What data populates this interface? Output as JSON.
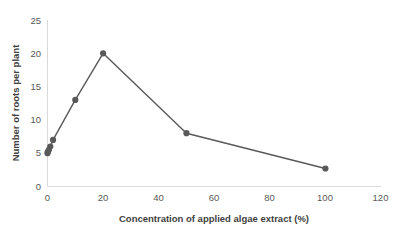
{
  "chart_data": {
    "type": "line",
    "title": "",
    "xlabel": "Concentration of applied algae extract (%)",
    "ylabel": "Number of roots per plant",
    "xlim": [
      0,
      120
    ],
    "ylim": [
      0,
      25
    ],
    "xticks": [
      "0",
      "20",
      "40",
      "60",
      "80",
      "100",
      "120"
    ],
    "yticks": [
      "0",
      "5",
      "10",
      "15",
      "20",
      "25"
    ],
    "grid": false,
    "legend": false,
    "series": [
      {
        "name": "roots per plant",
        "color": "#595959",
        "marker": "circle",
        "x": [
          0,
          0.1,
          0.5,
          1,
          2,
          10,
          20,
          50,
          100
        ],
        "y": [
          5.0,
          5.2,
          5.5,
          6.0,
          7.0,
          13.0,
          20.0,
          8.0,
          2.7
        ]
      }
    ]
  },
  "axes": {
    "x_tick_values": [
      0,
      20,
      40,
      60,
      80,
      100,
      120
    ],
    "y_tick_values": [
      0,
      5,
      10,
      15,
      20,
      25
    ],
    "axis_color": "#d9d9d9",
    "tick_text_color": "#595959",
    "title_color": "#404040"
  },
  "xlabels": {
    "t0": "0",
    "t1": "20",
    "t2": "40",
    "t3": "60",
    "t4": "80",
    "t5": "100",
    "t6": "120"
  },
  "ylabels": {
    "t0": "0",
    "t1": "5",
    "t2": "10",
    "t3": "15",
    "t4": "20",
    "t5": "25"
  },
  "titles": {
    "x_axis": "Concentration of applied algae extract (%)",
    "y_axis": "Number of roots per plant"
  }
}
